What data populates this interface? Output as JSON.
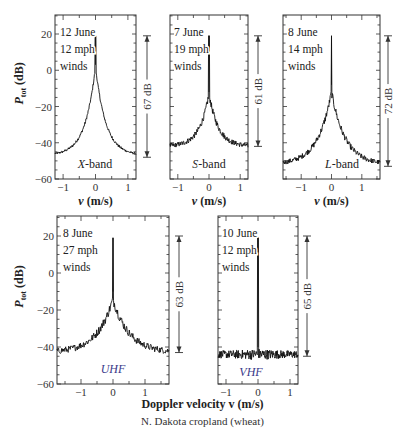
{
  "figure": {
    "common_xlabel": "Doppler velocity v (m/s)",
    "caption": "N. Dakota cropland (wheat)"
  },
  "chart_data": [
    {
      "type": "line",
      "band": "X-band",
      "annotation": [
        "12 June",
        "12 mph",
        "winds"
      ],
      "dynamic_range_label": "67 dB",
      "dynamic_range": [
        19,
        -48
      ],
      "ylabel": "P_tot (dB)",
      "xlabel": "v (m/s)",
      "xlim": [
        -1.25,
        1.25
      ],
      "ylim": [
        -60,
        30
      ],
      "xticks": [
        -1,
        0,
        1
      ],
      "yticks": [
        20,
        0,
        -20,
        -40,
        -60
      ],
      "peak_db": 19,
      "shoulder_db": 2,
      "floor_db": -47,
      "width": 0.32,
      "noise": 1.0,
      "series": [
        {
          "name": "X-band spectrum",
          "x": [
            -1.25,
            -1.0,
            -0.75,
            -0.5,
            -0.25,
            -0.1,
            0,
            0.1,
            0.25,
            0.5,
            0.75,
            1.0,
            1.25
          ],
          "y": [
            -47,
            -46,
            -43,
            -36,
            -20,
            -8,
            19,
            -8,
            -20,
            -36,
            -43,
            -46,
            -47
          ]
        }
      ]
    },
    {
      "type": "line",
      "band": "S-band",
      "annotation": [
        "7 June",
        "19 mph",
        "winds"
      ],
      "dynamic_range_label": "61 dB",
      "dynamic_range": [
        19,
        -42
      ],
      "ylabel": "P_tot (dB)",
      "xlabel": "v (m/s)",
      "xlim": [
        -1.25,
        1.25
      ],
      "ylim": [
        -60,
        30
      ],
      "xticks": [
        -1,
        0,
        1
      ],
      "yticks": [
        20,
        0,
        -20,
        -40,
        -60
      ],
      "peak_db": 19,
      "shoulder_db": -13,
      "floor_db": -42,
      "width": 0.3,
      "noise": 2.0,
      "series": [
        {
          "name": "S-band spectrum",
          "x": [
            -1.25,
            -1.0,
            -0.75,
            -0.5,
            -0.25,
            0,
            0.25,
            0.5,
            0.75,
            1.0,
            1.25
          ],
          "y": [
            -42,
            -42,
            -41,
            -33,
            -20,
            19,
            -20,
            -33,
            -41,
            -42,
            -42
          ]
        }
      ]
    },
    {
      "type": "line",
      "band": "L-band",
      "annotation": [
        "8 June",
        "14 mph",
        "winds"
      ],
      "dynamic_range_label": "72 dB",
      "dynamic_range": [
        19,
        -53
      ],
      "ylabel": "P_tot (dB)",
      "xlabel": "v (m/s)",
      "xlim": [
        -1.6,
        1.6
      ],
      "ylim": [
        -60,
        30
      ],
      "xticks": [
        -1,
        0,
        1
      ],
      "yticks": [
        20,
        0,
        -20,
        -40,
        -60
      ],
      "peak_db": 19,
      "shoulder_db": -12,
      "floor_db": -52,
      "width": 0.45,
      "noise": 2.2,
      "series": [
        {
          "name": "L-band spectrum",
          "x": [
            -1.6,
            -1.2,
            -0.8,
            -0.4,
            0,
            0.4,
            0.8,
            1.2,
            1.6
          ],
          "y": [
            -52,
            -50,
            -44,
            -28,
            19,
            -28,
            -44,
            -50,
            -52
          ]
        }
      ]
    },
    {
      "type": "line",
      "band": "UHF",
      "annotation": [
        "8 June",
        "27 mph",
        "winds"
      ],
      "dynamic_range_label": "63 dB",
      "dynamic_range": [
        20,
        -43
      ],
      "ylabel": "P_tot (dB)",
      "xlabel": "",
      "xlim": [
        -1.75,
        1.75
      ],
      "ylim": [
        -60,
        30
      ],
      "xticks": [
        -1,
        0,
        1
      ],
      "yticks": [
        20,
        0,
        -20,
        -40,
        -60
      ],
      "peak_db": 19,
      "shoulder_db": -14,
      "floor_db": -43,
      "width": 0.5,
      "noise": 2.8,
      "series": [
        {
          "name": "UHF spectrum",
          "x": [
            -1.75,
            -1.25,
            -0.75,
            -0.4,
            0,
            0.4,
            0.75,
            1.25,
            1.75
          ],
          "y": [
            -43,
            -42,
            -35,
            -22,
            19,
            -22,
            -35,
            -42,
            -43
          ]
        }
      ]
    },
    {
      "type": "line",
      "band": "VHF",
      "annotation": [
        "10 June",
        "12 mph",
        "winds"
      ],
      "dynamic_range_label": "65 dB",
      "dynamic_range": [
        20,
        -45
      ],
      "ylabel": "",
      "xlabel": "",
      "xlim": [
        -1.25,
        1.25
      ],
      "ylim": [
        -60,
        30
      ],
      "xticks": [
        -1,
        0,
        1
      ],
      "yticks": [
        20,
        0,
        -20,
        -40,
        -60
      ],
      "peak_db": 19,
      "shoulder_db": -44,
      "floor_db": -44,
      "width": 0.05,
      "noise": 3.2,
      "series": [
        {
          "name": "VHF spectrum",
          "x": [
            -1.25,
            -0.5,
            -0.05,
            0,
            0.05,
            0.5,
            1.25
          ],
          "y": [
            -44,
            -44,
            -40,
            19,
            -40,
            -44,
            -44
          ]
        }
      ]
    }
  ],
  "layout": {
    "panels": [
      {
        "left": 55,
        "right": 136,
        "top": 15,
        "bottom": 179,
        "y20": 34,
        "ym60": 179,
        "ylabel": true,
        "xlabel": true,
        "range_x": 147,
        "ann_x": 60,
        "band_x": 95,
        "band_y": 168,
        "band_color": "#222"
      },
      {
        "left": 170,
        "right": 248,
        "top": 15,
        "bottom": 179,
        "y20": 34,
        "ym60": 179,
        "ylabel": false,
        "xlabel": true,
        "range_x": 258,
        "ann_x": 174,
        "band_x": 209,
        "band_y": 168,
        "band_color": "#222"
      },
      {
        "left": 283,
        "right": 380,
        "top": 15,
        "bottom": 179,
        "y20": 34,
        "ym60": 179,
        "ylabel": false,
        "xlabel": true,
        "range_x": 388,
        "ann_x": 288,
        "band_x": 342,
        "band_y": 168,
        "band_color": "#222"
      },
      {
        "left": 57,
        "right": 169,
        "top": 216,
        "bottom": 384,
        "y20": 236,
        "ym60": 384,
        "ylabel": true,
        "xlabel": false,
        "range_x": 179,
        "ann_x": 63,
        "band_x": 113,
        "band_y": 373,
        "band_color": "#3a3a8a"
      },
      {
        "left": 218,
        "right": 298,
        "top": 216,
        "bottom": 384,
        "y20": 236,
        "ym60": 384,
        "ylabel": false,
        "xlabel": false,
        "range_x": 307,
        "ann_x": 222,
        "band_x": 251,
        "band_y": 376,
        "band_color": "#3a3a8a"
      }
    ]
  }
}
